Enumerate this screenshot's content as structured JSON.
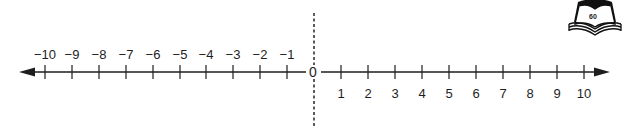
{
  "diagram": {
    "type": "number-line",
    "colors": {
      "line": "#1e1e1e",
      "dashed": "#333333",
      "background": "#ffffff"
    },
    "negative": {
      "labels": [
        "−10",
        "−9",
        "−8",
        "−7",
        "−6",
        "−5",
        "−4",
        "−3",
        "−2",
        "−1"
      ],
      "x": [
        45,
        72,
        99,
        126,
        153,
        180,
        206,
        233,
        260,
        287
      ]
    },
    "zero": {
      "label": "0",
      "x": 313
    },
    "positive": {
      "labels": [
        "1",
        "2",
        "3",
        "4",
        "5",
        "6",
        "7",
        "8",
        "9",
        "10"
      ],
      "x": [
        341,
        368,
        395,
        422,
        449,
        476,
        503,
        530,
        557,
        584
      ]
    },
    "book_icon": {
      "name": "open-book-icon",
      "page_number": "60"
    }
  }
}
